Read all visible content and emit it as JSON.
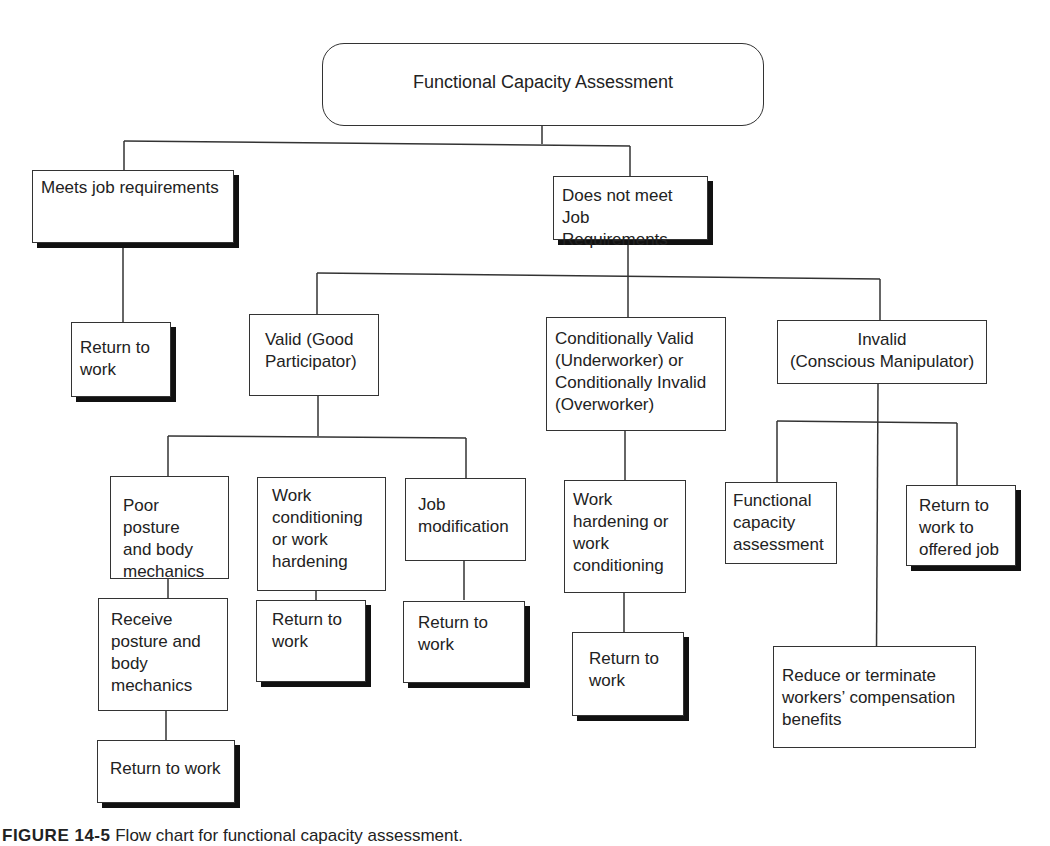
{
  "diagram": {
    "type": "flowchart",
    "root": {
      "label": "Functional Capacity Assessment"
    },
    "nodes": {
      "meets": {
        "label": "Meets job requirements"
      },
      "meets_return": {
        "label": "Return to\nwork"
      },
      "does_not_meet": {
        "label": "Does not meet\nJob Requirements"
      },
      "valid": {
        "label": "Valid (Good\nParticipator)"
      },
      "conditional": {
        "label": "Conditionally Valid\n(Underworker) or\nConditionally Invalid\n(Overworker)"
      },
      "invalid": {
        "label": "Invalid\n(Conscious Manipulator)"
      },
      "poor_posture": {
        "label": "Poor posture\nand body\nmechanics"
      },
      "receive_posture": {
        "label": "Receive\nposture and\nbody\nmechanics"
      },
      "posture_return": {
        "label": "Return to work"
      },
      "work_conditioning": {
        "label": "Work\nconditioning\nor work\nhardening"
      },
      "conditioning_return": {
        "label": "Return to\nwork"
      },
      "job_mod": {
        "label": "Job\nmodification"
      },
      "job_mod_return": {
        "label": "Return to\nwork"
      },
      "work_hardening": {
        "label": "Work\nhardening or\nwork\nconditioning"
      },
      "hardening_return": {
        "label": "Return to\nwork"
      },
      "fca": {
        "label": "Functional\ncapacity\nassessment"
      },
      "offered_job": {
        "label": "Return to\nwork to\noffered job"
      },
      "reduce_benefits": {
        "label": "Reduce or terminate\nworkers’ compensation\nbenefits"
      }
    },
    "edges": [
      [
        "root",
        "meets"
      ],
      [
        "root",
        "does_not_meet"
      ],
      [
        "meets",
        "meets_return"
      ],
      [
        "does_not_meet",
        "valid"
      ],
      [
        "does_not_meet",
        "conditional"
      ],
      [
        "does_not_meet",
        "invalid"
      ],
      [
        "valid",
        "poor_posture"
      ],
      [
        "valid",
        "work_conditioning"
      ],
      [
        "valid",
        "job_mod"
      ],
      [
        "poor_posture",
        "receive_posture"
      ],
      [
        "receive_posture",
        "posture_return"
      ],
      [
        "work_conditioning",
        "conditioning_return"
      ],
      [
        "job_mod",
        "job_mod_return"
      ],
      [
        "conditional",
        "work_hardening"
      ],
      [
        "work_hardening",
        "hardening_return"
      ],
      [
        "invalid",
        "fca"
      ],
      [
        "invalid",
        "offered_job"
      ],
      [
        "invalid",
        "reduce_benefits"
      ]
    ],
    "caption": {
      "figure_label": "FIGURE 14-5",
      "text": "Flow chart for functional capacity assessment."
    }
  }
}
